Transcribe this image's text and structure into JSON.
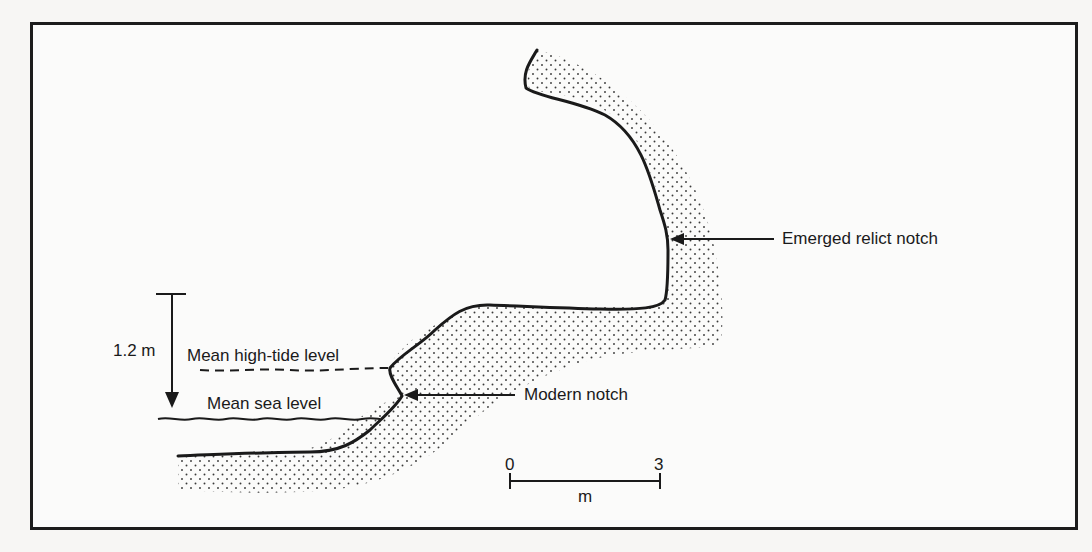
{
  "figure": {
    "labels": {
      "emerged_notch": "Emerged relict notch",
      "modern_notch": "Modern notch",
      "high_tide": "Mean high-tide level",
      "sea_level": "Mean sea level",
      "tidal_range": "1.2 m"
    },
    "scale_bar": {
      "start": "0",
      "end": "3",
      "unit": "m"
    },
    "colors": {
      "ink": "#1a1a1a",
      "stipple": "#3a3a3a",
      "background": "#fbfbfa"
    }
  }
}
